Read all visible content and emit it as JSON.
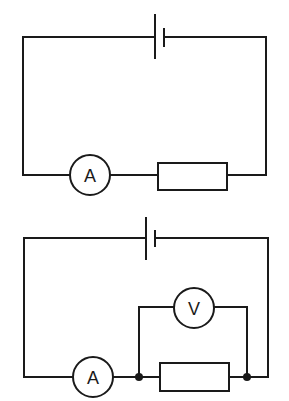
{
  "diagram": {
    "type": "circuit-diagrams",
    "colors": {
      "line": "#1a1a1a",
      "background": "#ffffff"
    },
    "circuits": [
      {
        "id": "circuit-1",
        "components": [
          {
            "type": "cell",
            "label": ""
          },
          {
            "type": "ammeter",
            "label": "A"
          },
          {
            "type": "resistor",
            "label": ""
          }
        ]
      },
      {
        "id": "circuit-2",
        "components": [
          {
            "type": "cell",
            "label": ""
          },
          {
            "type": "ammeter",
            "label": "A"
          },
          {
            "type": "resistor",
            "label": ""
          },
          {
            "type": "voltmeter",
            "label": "V",
            "connection": "parallel with resistor"
          },
          {
            "type": "junction",
            "label": ""
          },
          {
            "type": "junction",
            "label": ""
          }
        ]
      }
    ]
  }
}
